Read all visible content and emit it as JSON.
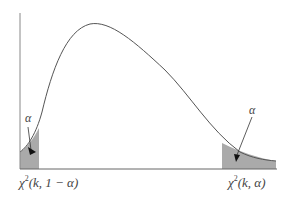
{
  "diagram": {
    "left_alpha_label": "α",
    "right_alpha_label": "α",
    "left_critical_label": {
      "chi": "χ",
      "sup": "2",
      "args": "(k, 1 − α)"
    },
    "right_critical_label": {
      "chi": "χ",
      "sup": "2",
      "args": "(k,  α)"
    },
    "colors": {
      "curve": "#555555",
      "axis": "#777777",
      "shade": "#a9a9a9",
      "text": "#444444"
    }
  }
}
